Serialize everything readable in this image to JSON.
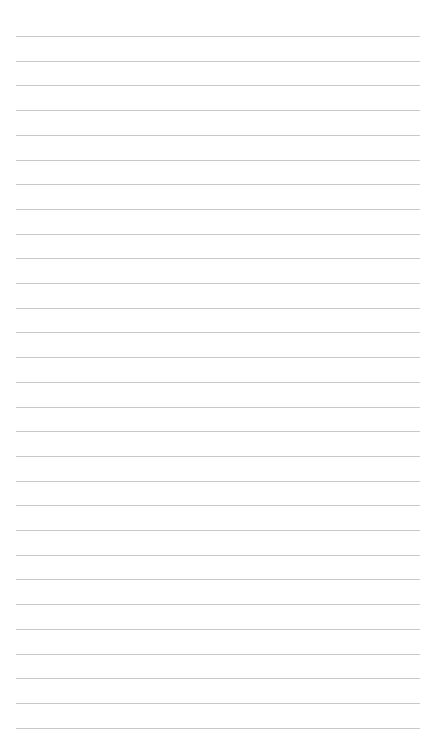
{
  "page": {
    "type": "lined-paper",
    "background_color": "#ffffff",
    "line_color": "#c9c9c9",
    "line_count": 29,
    "first_line_y": 36,
    "line_spacing": 24.7,
    "line_left": 16,
    "line_right": 420,
    "text_content": ""
  }
}
